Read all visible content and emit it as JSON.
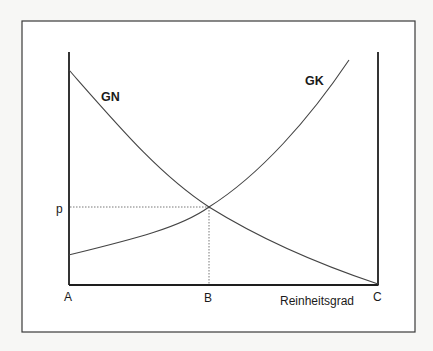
{
  "diagram": {
    "type": "supply-demand-style economic diagram",
    "curves": [
      {
        "id": "GN",
        "label": "GN",
        "shape": "decreasing convex",
        "from_point": "top of left axis A",
        "to_point": "C"
      },
      {
        "id": "GK",
        "label": "GK",
        "shape": "increasing convex",
        "from_point": "left axis above A",
        "to_point": "top right, before right axis"
      }
    ],
    "axis_labels": {
      "origin": "A",
      "intersection_x": "B",
      "right_end": "C",
      "x_axis_title": "Reinheitsgrad",
      "y_intersection": "p"
    },
    "guides": {
      "horizontal": "p",
      "vertical": "B"
    },
    "colors": {
      "background": "#f7f7f5",
      "frame": "#3a3a3a",
      "axis": "#1e1e1e",
      "curve": "#444444",
      "guide": "#6a6a6a",
      "text": "#1a1a1a"
    }
  }
}
